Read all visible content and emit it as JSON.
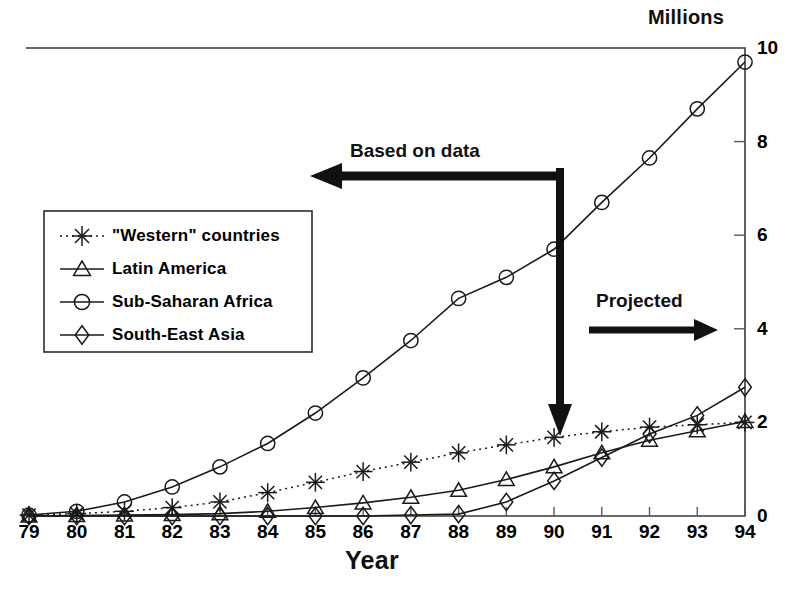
{
  "chart_data": {
    "type": "line",
    "title": "",
    "xlabel": "Year",
    "ylabel": "Millions",
    "ylabel_position": "top-right",
    "axis_side": "right",
    "grid": false,
    "xlim": [
      79,
      94
    ],
    "ylim": [
      0,
      10
    ],
    "x": [
      79,
      80,
      81,
      82,
      83,
      84,
      85,
      86,
      87,
      88,
      89,
      90,
      91,
      92,
      93,
      94
    ],
    "xtick_labels": [
      "79",
      "80",
      "81",
      "82",
      "83",
      "84",
      "85",
      "86",
      "87",
      "88",
      "89",
      "90",
      "91",
      "92",
      "93",
      "94"
    ],
    "ytick_labels": [
      "0",
      "2",
      "4",
      "6",
      "8",
      "10"
    ],
    "yticks": [
      0,
      2,
      4,
      6,
      8,
      10
    ],
    "series": [
      {
        "name": "\"Western\" countries",
        "marker": "asterisk",
        "line_style": "dotted",
        "values": [
          0.02,
          0.05,
          0.1,
          0.18,
          0.3,
          0.5,
          0.72,
          0.95,
          1.15,
          1.35,
          1.52,
          1.68,
          1.8,
          1.9,
          1.95,
          2.0
        ]
      },
      {
        "name": "Latin America",
        "marker": "triangle",
        "line_style": "solid",
        "values": [
          0.0,
          0.01,
          0.02,
          0.03,
          0.05,
          0.1,
          0.18,
          0.28,
          0.4,
          0.55,
          0.78,
          1.05,
          1.35,
          1.62,
          1.82,
          2.02
        ]
      },
      {
        "name": "Sub-Saharan Africa",
        "marker": "circle",
        "line_style": "solid",
        "values": [
          0.02,
          0.1,
          0.3,
          0.62,
          1.05,
          1.55,
          2.2,
          2.95,
          3.75,
          4.65,
          5.1,
          5.7,
          6.7,
          7.65,
          8.7,
          9.7
        ]
      },
      {
        "name": "South-East Asia",
        "marker": "diamond",
        "line_style": "solid",
        "values": [
          0.0,
          0.0,
          0.0,
          0.0,
          0.0,
          0.0,
          0.0,
          0.0,
          0.02,
          0.04,
          0.3,
          0.75,
          1.25,
          1.75,
          2.15,
          2.75
        ]
      }
    ],
    "annotations": [
      {
        "id": "based-on-data",
        "text": "Based on data",
        "arrow": "left",
        "x_at": 90
      },
      {
        "id": "projected",
        "text": "Projected",
        "arrow": "right",
        "x_at": 90
      },
      {
        "id": "divider",
        "text": "",
        "arrow": "down",
        "x_at": 90
      }
    ],
    "legend": {
      "position": "inside-left",
      "entries": [
        {
          "label": "\"Western\" countries",
          "marker": "asterisk",
          "line_style": "dotted"
        },
        {
          "label": "Latin America",
          "marker": "triangle",
          "line_style": "solid"
        },
        {
          "label": "Sub-Saharan Africa",
          "marker": "circle",
          "line_style": "solid"
        },
        {
          "label": "South-East Asia",
          "marker": "diamond",
          "line_style": "solid"
        }
      ]
    },
    "colors": {
      "ink": "#1a1a1a",
      "background": "#ffffff"
    }
  }
}
